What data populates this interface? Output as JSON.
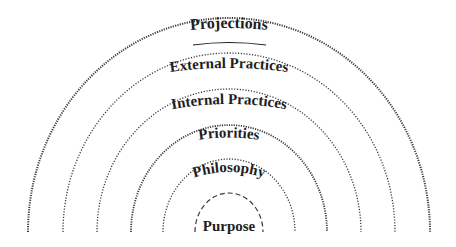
{
  "diagram": {
    "type": "concentric-semicircles",
    "center": {
      "x": 229,
      "y": 232
    },
    "line_color": "#3a3a3a",
    "text_color": "#1e1e1e",
    "layers": [
      {
        "label": "Projections",
        "rx": 201,
        "ry": 214,
        "dash": "dotted",
        "underline": true
      },
      {
        "label": "External Practices",
        "rx": 166,
        "ry": 179,
        "dash": "dotted",
        "underline": false
      },
      {
        "label": "Internal Practices",
        "rx": 132,
        "ry": 143,
        "dash": "dotted",
        "underline": false
      },
      {
        "label": "Priorities",
        "rx": 98,
        "ry": 107,
        "dash": "dotted",
        "underline": false
      },
      {
        "label": "Philosophy",
        "rx": 66,
        "ry": 73,
        "dash": "dotted",
        "underline": false
      },
      {
        "label": "Purpose",
        "rx": 34,
        "ry": 39,
        "dash": "dashed",
        "underline": false
      }
    ]
  }
}
